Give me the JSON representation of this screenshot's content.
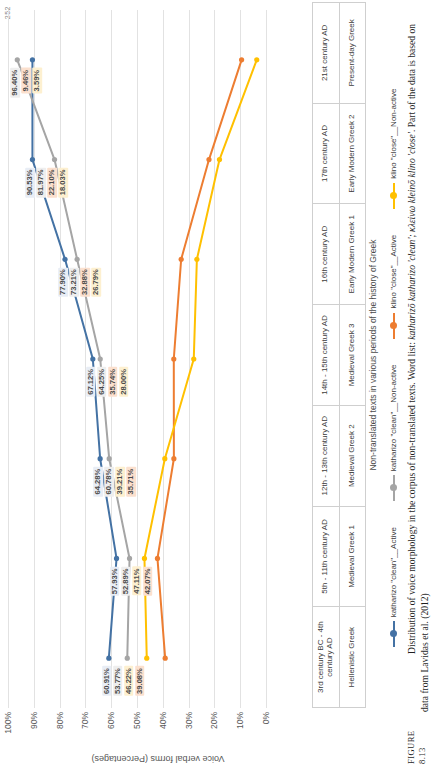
{
  "page": {
    "number": "252"
  },
  "figure": {
    "key": "FIGURE 8.13",
    "caption_main": "Distribution of voice morphology in the corpus of non-translated texts. Word list: ",
    "caption_italic": "katharizō katharizo 'clean'; κλείνω kleinō klino 'close'",
    "caption_tail": ". Part of the data is based on data from Lavidas et al. (2012)"
  },
  "chart_data": {
    "type": "line",
    "title": "",
    "xlabel": "Non-translated texts in various periods of the history of Greek",
    "ylabel": "Voice verbal forms (Percentages)",
    "ylim": [
      0,
      100
    ],
    "yticks": [
      "0%",
      "10%",
      "20%",
      "30%",
      "40%",
      "50%",
      "60%",
      "70%",
      "80%",
      "90%",
      "100%"
    ],
    "grid": true,
    "legend_position": "bottom",
    "categories": [
      "Hellenistic Greek",
      "Medieval Greek 1",
      "Medieval Greek 2",
      "Medieval Greek 3",
      "Early Modern Greek 1",
      "Early Modern Greek 2",
      "Present-day Greek"
    ],
    "period_dates": [
      "3rd century BC - 4th century AD",
      "5th - 11th century AD",
      "12th - 13th century AD",
      "14th - 15th century AD",
      "16th century AD",
      "17th century AD",
      "21st century AD"
    ],
    "series": [
      {
        "name": "katharizo \"clean\"__Active",
        "color": "#4472a4",
        "label_class": "lb-blue",
        "values": [
          60.91,
          57.93,
          64.28,
          67.12,
          77.9,
          90.53,
          90.53
        ],
        "labels": [
          "60.91%",
          "57.93%",
          "64.28%",
          "67.12%",
          "77.90%",
          "90.53%",
          ""
        ]
      },
      {
        "name": "katharizo \"clean\"__Non-active",
        "color": "#a5a5a5",
        "label_class": "lb-gray",
        "values": [
          53.77,
          52.89,
          60.78,
          64.25,
          73.21,
          81.97,
          96.4
        ],
        "labels": [
          "53.77%",
          "52.89%",
          "60.78%",
          "64.25%",
          "73.21%",
          "81.97%",
          "96.40%"
        ]
      },
      {
        "name": "klino \"close\"__Active",
        "color": "#ed7d31",
        "label_class": "lb-oran",
        "values": [
          39.08,
          42.07,
          35.71,
          35.74,
          32.88,
          22.1,
          9.46
        ],
        "labels": [
          "39.08%",
          "42.07%",
          "35.71%",
          "35.74%",
          "32.88%",
          "22.10%",
          "9.46%"
        ]
      },
      {
        "name": "klino \"close\"__Non-active",
        "color": "#ffc000",
        "label_class": "lb-yell",
        "values": [
          46.22,
          47.11,
          39.21,
          28.0,
          26.79,
          18.03,
          3.59
        ],
        "labels": [
          "46.22%",
          "47.11%",
          "39.21%",
          "28.00%",
          "26.79%",
          "18.03%",
          "3.59%"
        ]
      }
    ],
    "legend": [
      {
        "label": "katharizo \"clean\"__Active",
        "color": "#4472a4"
      },
      {
        "label": "katharizo \"clean\"__Non-active",
        "color": "#a5a5a5"
      },
      {
        "label": "klino \"close\"__Active",
        "color": "#ed7d31"
      },
      {
        "label": "klino \"close\"__Non-active",
        "color": "#ffc000"
      }
    ]
  }
}
